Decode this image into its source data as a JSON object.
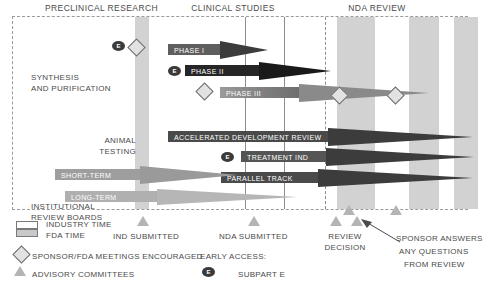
{
  "headers": [
    {
      "label": "PRECLINICAL RESEARCH",
      "left": 14,
      "top": 3,
      "width": 175
    },
    {
      "label": "CLINICAL STUDIES",
      "left": 168,
      "top": 3,
      "width": 130
    },
    {
      "label": "NDA REVIEW",
      "left": 318,
      "top": 3,
      "width": 118
    }
  ],
  "row_labels": [
    {
      "text": "SYNTHESIS",
      "left": 18,
      "top": 55,
      "width": 110,
      "align": "left"
    },
    {
      "text": "AND PURIFICATION",
      "left": 18,
      "top": 66,
      "width": 110,
      "align": "left"
    },
    {
      "text": "ANIMAL",
      "left": 55,
      "top": 118,
      "width": 68,
      "align": "right"
    },
    {
      "text": "TESTING",
      "left": 55,
      "top": 129,
      "width": 68,
      "align": "right"
    },
    {
      "text": "INSTITUTIONAL",
      "left": 18,
      "top": 184,
      "width": 110,
      "align": "left"
    },
    {
      "text": "REVIEW BOARDS",
      "left": 18,
      "top": 195,
      "width": 110,
      "align": "left"
    }
  ],
  "bars": [
    {
      "name": "phase-1",
      "label": "PHASE I",
      "left": 155,
      "top": 27,
      "body_w": 52,
      "tip_w": 48,
      "tip_h": 18,
      "color": "#5e5e5e",
      "tip_color": "#3c3c3c",
      "gradient": false
    },
    {
      "name": "phase-2",
      "label": "PHASE II",
      "left": 172,
      "top": 48,
      "body_w": 74,
      "tip_w": 72,
      "tip_h": 19,
      "color": "#262626",
      "tip_color": "#1a1a1a",
      "gradient": false
    },
    {
      "name": "phase-3",
      "label": "PHASE III",
      "left": 207,
      "top": 70,
      "body_w": 79,
      "tip_w": 130,
      "tip_h": 18,
      "color": "#9a9a9a",
      "tip_color": "#8a8a8a",
      "gradient": true
    },
    {
      "name": "accelerated-development-review",
      "label": "ACCELERATED DEVELOPMENT REVIEW",
      "left": 155,
      "top": 114,
      "body_w": 160,
      "tip_w": 145,
      "tip_h": 18,
      "color": "#4a4a4a",
      "tip_color": "#3c3c3c",
      "gradient": false
    },
    {
      "name": "treatment-ind",
      "label": "TREATMENT IND",
      "left": 228,
      "top": 134,
      "body_w": 85,
      "tip_w": 148,
      "tip_h": 19,
      "color": "#555555",
      "tip_color": "#3c3c3c",
      "gradient": false
    },
    {
      "name": "parallel-track",
      "label": "PARALLEL TRACK",
      "left": 208,
      "top": 155,
      "body_w": 97,
      "tip_w": 155,
      "tip_h": 19,
      "color": "#4a4a4a",
      "tip_color": "#3c3c3c",
      "gradient": false
    },
    {
      "name": "short-term",
      "label": "SHORT-TERM",
      "left": 42,
      "top": 152,
      "body_w": 85,
      "tip_w": 98,
      "tip_h": 18,
      "color": "#9e9e9e",
      "tip_color": "#9a9a9a",
      "gradient": false
    },
    {
      "name": "long-term",
      "label": "LONG-TERM",
      "left": 52,
      "top": 174,
      "body_w": 92,
      "tip_w": 140,
      "tip_h": 17,
      "color": "#b0b0b0",
      "tip_color": "#b6b6b6",
      "gradient": false
    }
  ],
  "bands": [
    {
      "name": "band-preclinical-end",
      "left": 122,
      "width": 14,
      "shade": "dark"
    },
    {
      "name": "band-nda-first",
      "left": 324,
      "width": 38,
      "shade": "dark"
    },
    {
      "name": "band-nda-second",
      "left": 396,
      "width": 30,
      "shade": "dark"
    },
    {
      "name": "band-nda-edge",
      "left": 441,
      "width": 24,
      "shade": "dark"
    }
  ],
  "rules": [
    {
      "name": "rule-phase1-end",
      "left": 232,
      "style": "solid"
    },
    {
      "name": "rule-phase2-end",
      "left": 271,
      "style": "solid"
    },
    {
      "name": "rule-nda-start",
      "left": 312,
      "style": "dashed"
    }
  ],
  "diamonds": [
    {
      "name": "diamond-preclinical",
      "left": 117,
      "top": 24
    },
    {
      "name": "diamond-phase3-start",
      "left": 185,
      "top": 68
    },
    {
      "name": "diamond-nda-1",
      "left": 320,
      "top": 72
    },
    {
      "name": "diamond-nda-2",
      "left": 376,
      "top": 72
    }
  ],
  "triangles_in_chart": [
    {
      "name": "triangle-review-1",
      "left": 330,
      "top": 188
    },
    {
      "name": "triangle-review-2",
      "left": 377,
      "top": 188
    }
  ],
  "ellipses": [
    {
      "name": "early-access-preclinical",
      "label": "E",
      "left": 99,
      "top": 24
    },
    {
      "name": "early-access-phase2",
      "label": "E",
      "left": 155,
      "top": 49
    },
    {
      "name": "early-access-treatment-ind",
      "label": "E",
      "left": 208,
      "top": 135
    }
  ],
  "legend": {
    "industry_time": "INDUSTRY TIME",
    "fda_time": "FDA TIME",
    "sponsor_meetings": "SPONSOR/FDA MEETINGS ENCOURAGED",
    "advisory_committees": "ADVISORY COMMITTEES",
    "ind_submitted": "IND SUBMITTED",
    "nda_submitted": "NDA SUBMITTED",
    "review_decision_line1": "REVIEW",
    "review_decision_line2": "DECISION",
    "early_access_title": "EARLY ACCESS:",
    "subpart_e": "SUBPART E",
    "sponsor_answers_line1": "SPONSOR ANSWERS",
    "sponsor_answers_line2": "ANY QUESTIONS",
    "sponsor_answers_line3": "FROM REVIEW"
  },
  "colors": {
    "band": "#d2d2d2",
    "frame_border": "#9a9a9a",
    "text": "#4a4a4a",
    "marker_fill": "#b4b4b4",
    "dark_bar": "#262626"
  }
}
